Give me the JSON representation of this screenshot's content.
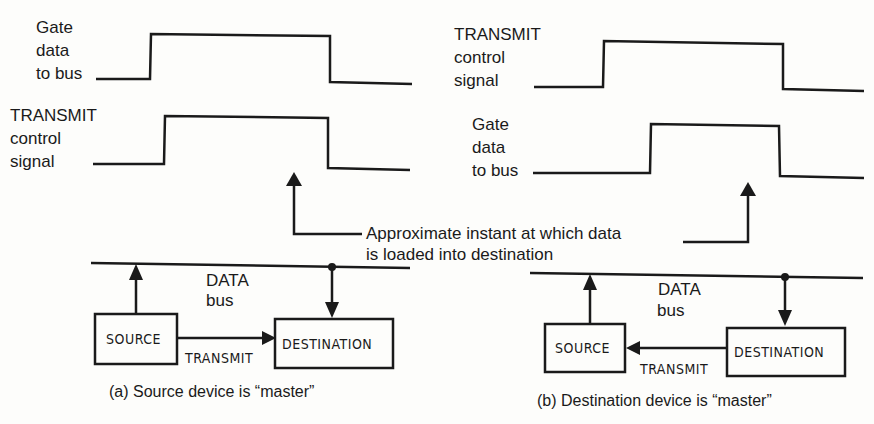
{
  "panel_a": {
    "waveform_top_label": [
      "Gate",
      "data",
      "to bus"
    ],
    "waveform_bottom_label": [
      "TRANSMIT",
      "control",
      "signal"
    ],
    "bus_label": [
      "DATA",
      "bus"
    ],
    "source_box": "SOURCE",
    "destination_box": "DESTINATION",
    "transmit_label": "TRANSMIT",
    "caption": "(a)  Source device is “master”"
  },
  "panel_b": {
    "waveform_top_label": [
      "TRANSMIT",
      "control",
      "signal"
    ],
    "waveform_bottom_label": [
      "Gate",
      "data",
      "to bus"
    ],
    "bus_label": [
      "DATA",
      "bus"
    ],
    "source_box": "SOURCE",
    "destination_box": "DESTINATION",
    "transmit_label": "TRANSMIT",
    "caption": "(b)  Destination device is “master”"
  },
  "annotation": [
    "Approximate instant at which data",
    "is loaded into destination"
  ],
  "colors": {
    "ink": "#1a1a1a",
    "paper": "#fdfdfb"
  }
}
